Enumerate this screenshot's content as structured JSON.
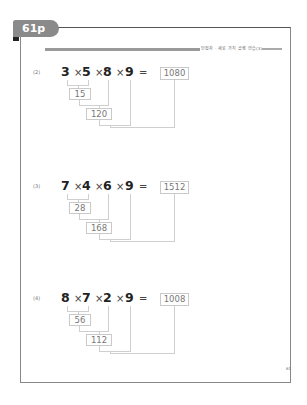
{
  "page_tab": {
    "label": "61p"
  },
  "header": {
    "title": "인접자 · 세로 가지 곱셈 연습(3)"
  },
  "page_number": "61",
  "problems": [
    {
      "label": "(2)",
      "numbers": [
        "3",
        "5",
        "8",
        "9"
      ],
      "operator": "×",
      "equals": "=",
      "answer": "1080",
      "step1": "15",
      "step2": "120"
    },
    {
      "label": "(3)",
      "numbers": [
        "7",
        "4",
        "6",
        "9"
      ],
      "operator": "×",
      "equals": "=",
      "answer": "1512",
      "step1": "28",
      "step2": "168"
    },
    {
      "label": "(4)",
      "numbers": [
        "8",
        "7",
        "2",
        "9"
      ],
      "operator": "×",
      "equals": "=",
      "answer": "1008",
      "step1": "56",
      "step2": "112"
    }
  ]
}
